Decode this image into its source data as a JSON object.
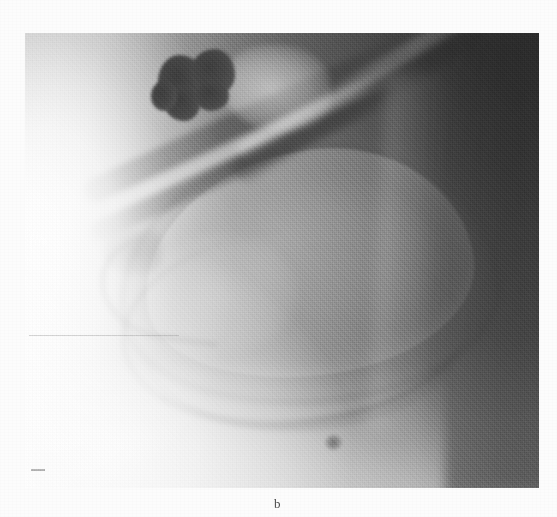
{
  "figure": {
    "panel_label": "b",
    "caption_position": "below-image",
    "modality": "radiograph",
    "colorspace": "grayscale",
    "page_background": "#fbfbfb"
  },
  "image": {
    "alt_description": "Grayscale radiographic (X-ray / fluoroscopic) image showing a contrast-filled hollow organ with two dense rounded opacities in the upper left region and diagonal tubular bands crossing the field",
    "frame": {
      "left": 25,
      "top": 33,
      "width": 514,
      "height": 455
    },
    "exposure": {
      "left_tone": "#fdfdfd",
      "mid_tone": "#8a8a8a",
      "right_tone": "#585858",
      "gradient_direction": "left-to-right light-to-dark"
    },
    "features": [
      {
        "name": "gallstone-cluster",
        "label": "dense rounded opacities",
        "count": 2,
        "tone": "#434343"
      },
      {
        "name": "organ-outline",
        "label": "contrast-filled organ lumen",
        "tone": "#9a9a9a"
      },
      {
        "name": "diagonal-duct-band",
        "label": "oblique tubular band",
        "tone": "#4f4f4f"
      },
      {
        "name": "oblique-rib-band",
        "label": "upper oblique band to top-right",
        "tone": "#454545"
      },
      {
        "name": "fundus-tip",
        "label": "left converging tip",
        "tone": "#6b6b6b"
      },
      {
        "name": "inferior-border-arc",
        "label": "inferior contour arc",
        "tone": "#5f5f5f"
      },
      {
        "name": "dark-speck",
        "label": "small focal density",
        "tone": "#3f3f3f"
      }
    ]
  },
  "colors": {
    "page": "#fbfbfb",
    "film_light": "#fdfdfd",
    "film_mid": "#8a8a8a",
    "film_dark": "#585858",
    "opacity_dark": "#434343",
    "caption_text": "#4a4a4a"
  }
}
